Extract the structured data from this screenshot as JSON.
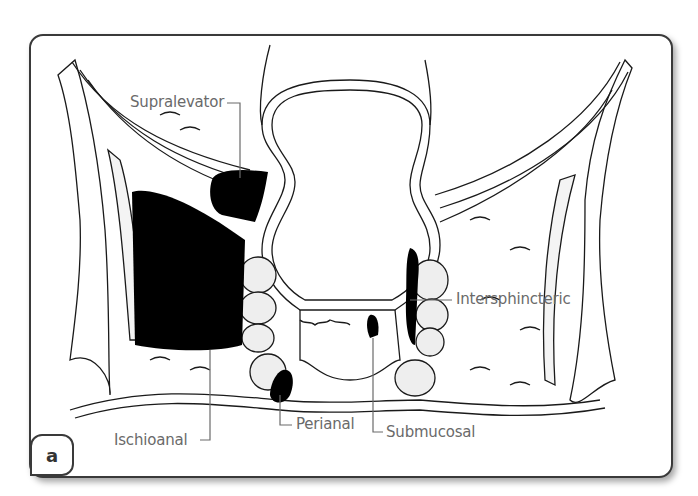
{
  "figure": {
    "panel_label": "a",
    "labels": {
      "supralevator": "Supralevator",
      "intersphincteric": "Intersphincteric",
      "ischioanal": "Ischioanal",
      "perianal": "Perianal",
      "submucosal": "Submucosal"
    }
  },
  "colors": {
    "frame_border": "#3a3a3a",
    "label_text": "#6a6a6a",
    "abscess_fill": "#000000",
    "line_art": "#1a1a1a"
  }
}
